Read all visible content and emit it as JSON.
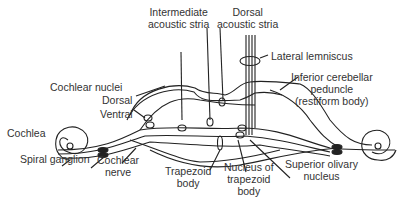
{
  "diagram": {
    "labels": {
      "intermediate_stria_1": "Intermediate",
      "intermediate_stria_2": "acoustic stria",
      "dorsal_stria_1": "Dorsal",
      "dorsal_stria_2": "acoustic stria",
      "lateral_lemniscus": "Lateral lemniscus",
      "cochlear_nuclei": "Cochlear nuclei",
      "dorsal": "Dorsal",
      "ventral": "Ventral",
      "icp_1": "Inferior cerebellar",
      "icp_2": "peduncle",
      "icp_3": "(restiform body)",
      "cochlea": "Cochlea",
      "spiral_ganglion": "Spiral ganglion",
      "cochlear_nerve_1": "Cochlear",
      "cochlear_nerve_2": "nerve",
      "trapezoid_body_1": "Trapezoid",
      "trapezoid_body_2": "body",
      "ntb_1": "Nucleus of",
      "ntb_2": "trapezoid",
      "ntb_3": "body",
      "son_1": "Superior olivary",
      "son_2": "nucleus"
    },
    "colors": {
      "line": "#222222",
      "text": "#333333",
      "background": "#ffffff"
    }
  }
}
